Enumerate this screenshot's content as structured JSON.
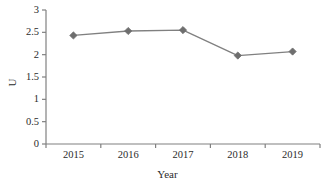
{
  "chart_data": {
    "type": "line",
    "title": "",
    "subtitle": "",
    "xlabel": "Year",
    "ylabel": "U",
    "categories": [
      "2015",
      "2016",
      "2017",
      "2018",
      "2019"
    ],
    "x": [
      2015,
      2016,
      2017,
      2018,
      2019
    ],
    "values": [
      2.43,
      2.53,
      2.55,
      1.98,
      2.07
    ],
    "series": [
      {
        "name": "U",
        "values": [
          2.43,
          2.53,
          2.55,
          1.98,
          2.07
        ]
      }
    ],
    "ylim": [
      0,
      3
    ],
    "ytick_labels": [
      "0",
      "0.5",
      "1",
      "1.5",
      "2",
      "2.5",
      "3"
    ],
    "ytick_values": [
      0,
      0.5,
      1,
      1.5,
      2,
      2.5,
      3
    ],
    "xtick_labels": [
      "2015",
      "2016",
      "2017",
      "2018",
      "2019"
    ],
    "grid": false,
    "legend": false,
    "legend_position": "none",
    "marker": "diamond",
    "line_color": "#808080",
    "marker_color": "#6e6e6e",
    "axis_color": "#808080",
    "text_color": "#2b2b2b",
    "background": "#ffffff",
    "annotations": []
  }
}
